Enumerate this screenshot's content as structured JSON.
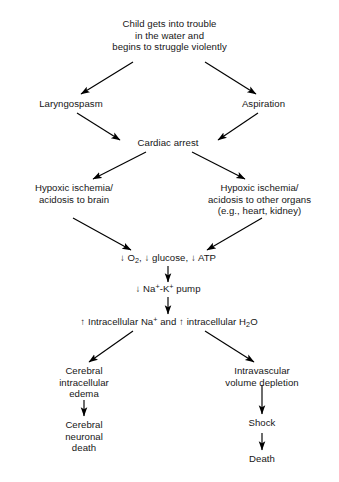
{
  "diagram": {
    "background_color": "#ffffff",
    "text_color": "#161616",
    "edge_color": "#000000",
    "nodes": {
      "child_trouble": {
        "line1": "Child gets into trouble",
        "line2": "in the water and",
        "line3": "begins to struggle violently"
      },
      "laryngospasm": {
        "line1": "Laryngospasm"
      },
      "aspiration": {
        "line1": "Aspiration"
      },
      "cardiac_arrest": {
        "line1": "Cardiac arrest"
      },
      "hypoxic_brain": {
        "line1": "Hypoxic ischemia/",
        "line2": "acidosis to brain"
      },
      "hypoxic_organs": {
        "line1": "Hypoxic ischemia/",
        "line2": "acidosis to other organs",
        "line3": "(e.g., heart, kidney)"
      },
      "o2_glucose_atp": {
        "prefix1": "↓ O",
        "sub1": "2",
        "mid": ", ↓ glucose, ↓ ATP"
      },
      "na_k_pump": {
        "prefix": "↓ Na",
        "sup1": "+",
        "mid": "-K",
        "sup2": "+",
        "suffix": " pump"
      },
      "intracellular": {
        "prefix": "↑ Intracellular Na",
        "sup1": "+",
        "mid": " and ↑ intracellular H",
        "sub1": "2",
        "suffix": "O"
      },
      "cerebral_edema": {
        "line1": "Cerebral",
        "line2": "intracellular",
        "line3": "edema"
      },
      "intravascular_depletion": {
        "line1": "Intravascular",
        "line2": "volume depletion"
      },
      "cerebral_death": {
        "line1": "Cerebral",
        "line2": "neuronal",
        "line3": "death"
      },
      "shock": {
        "line1": "Shock"
      },
      "death": {
        "line1": "Death"
      }
    },
    "edges": [
      {
        "from": "child_trouble",
        "to": "laryngospasm",
        "style": "diagonal-left"
      },
      {
        "from": "child_trouble",
        "to": "aspiration",
        "style": "diagonal-right"
      },
      {
        "from": "laryngospasm",
        "to": "cardiac_arrest",
        "style": "diagonal-right"
      },
      {
        "from": "aspiration",
        "to": "cardiac_arrest",
        "style": "diagonal-left"
      },
      {
        "from": "cardiac_arrest",
        "to": "hypoxic_brain",
        "style": "diagonal-left"
      },
      {
        "from": "cardiac_arrest",
        "to": "hypoxic_organs",
        "style": "diagonal-right"
      },
      {
        "from": "hypoxic_brain",
        "to": "o2_glucose_atp",
        "style": "diagonal-right"
      },
      {
        "from": "hypoxic_organs",
        "to": "o2_glucose_atp",
        "style": "diagonal-left"
      },
      {
        "from": "o2_glucose_atp",
        "to": "na_k_pump",
        "style": "vertical"
      },
      {
        "from": "na_k_pump",
        "to": "intracellular",
        "style": "vertical"
      },
      {
        "from": "intracellular",
        "to": "cerebral_edema",
        "style": "diagonal-left"
      },
      {
        "from": "intracellular",
        "to": "intravascular_depletion",
        "style": "diagonal-right"
      },
      {
        "from": "cerebral_edema",
        "to": "cerebral_death",
        "style": "vertical"
      },
      {
        "from": "intravascular_depletion",
        "to": "shock",
        "style": "vertical"
      },
      {
        "from": "shock",
        "to": "death",
        "style": "vertical"
      }
    ]
  }
}
